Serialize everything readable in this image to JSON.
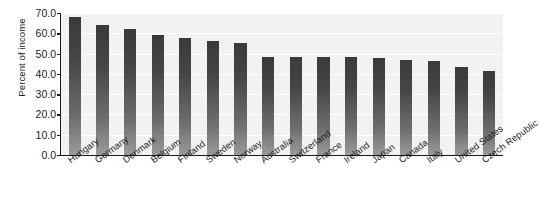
{
  "chart_data": {
    "type": "bar",
    "title": "",
    "subtitle": "",
    "xlabel": "",
    "ylabel": "Percent of income",
    "ylim": [
      0.0,
      70.0
    ],
    "ytick_step": 10.0,
    "ytick_labels": [
      "70.0",
      "60.0",
      "50.0",
      "40.0",
      "30.0",
      "20.0",
      "10.0",
      "0.0"
    ],
    "ytick_values": [
      70.0,
      60.0,
      50.0,
      40.0,
      30.0,
      20.0,
      10.0,
      0.0
    ],
    "grid": true,
    "grid_axis": "y",
    "legend": false,
    "legend_position": "none",
    "orientation": "vertical",
    "sorted": "descending",
    "bar_color": "#4a4a4a",
    "bar_gradient_top": "#3a3a3a",
    "bar_gradient_bottom": "#9a9a9a",
    "plot_background": "#f2f2f0",
    "axis_color": "#1a1a1a",
    "categories": [
      "Hungary",
      "Germany",
      "Denmark",
      "Belgium",
      "Finland",
      "Sweden",
      "Norway",
      "Australia",
      "Switzerland",
      "France",
      "Ireland",
      "Japan",
      "Canada",
      "Italy",
      "United States",
      "Czech Republic"
    ],
    "values": [
      68.0,
      64.0,
      62.0,
      59.2,
      57.5,
      56.0,
      55.0,
      48.5,
      48.4,
      48.2,
      48.2,
      48.0,
      46.6,
      46.4,
      43.5,
      41.5
    ]
  }
}
